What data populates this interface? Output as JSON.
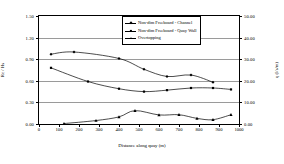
{
  "chart_data": {
    "type": "line",
    "title": "",
    "xlabel": "Distance along quay (m)",
    "ylabel": "Rc / Hs",
    "ylabel_right": "q (l/s/m)",
    "xlim": [
      0,
      1000
    ],
    "ylim": [
      0.0,
      1.5
    ],
    "ylim_right": [
      0.0,
      50.0
    ],
    "xticks": [
      0,
      100,
      200,
      300,
      400,
      500,
      600,
      700,
      800,
      900,
      1000
    ],
    "xticklabels": [
      "0",
      "100",
      "200",
      "300",
      "400",
      "500",
      "600",
      "700",
      "800",
      "900",
      "1000"
    ],
    "yticks": [
      0.0,
      0.3,
      0.6,
      0.9,
      1.2,
      1.5
    ],
    "yticklabels": [
      "0.00",
      "0.30",
      "0.60",
      "0.90",
      "1.20",
      "1.50"
    ],
    "yticks_right": [
      0.0,
      10.0,
      20.0,
      30.0,
      40.0,
      50.0
    ],
    "yticklabels_right": [
      "0.00",
      "10.00",
      "20.00",
      "30.00",
      "40.00",
      "50.00"
    ],
    "grid": true,
    "legend_position": "upper center",
    "series": [
      {
        "name": "Non-dim Freeboard - Channel",
        "axis": "left",
        "marker": "diamond",
        "x": [
          60,
          175,
          400,
          525,
          640,
          760,
          870
        ],
        "y": [
          0.97,
          1.0,
          0.91,
          0.76,
          0.66,
          0.68,
          0.58
        ]
      },
      {
        "name": "Non-dim Freeboard - Quay Wall",
        "axis": "left",
        "marker": "square",
        "x": [
          60,
          245,
          400,
          525,
          640,
          760,
          870,
          960
        ],
        "y": [
          0.78,
          0.59,
          0.49,
          0.45,
          0.47,
          0.5,
          0.5,
          0.48
        ]
      },
      {
        "name": "Overtopping",
        "axis": "right",
        "marker": "triangle",
        "x": [
          125,
          285,
          400,
          480,
          600,
          700,
          790,
          870,
          960
        ],
        "y": [
          0.2,
          1.6,
          3.3,
          6.2,
          4.2,
          4.3,
          2.6,
          2.0,
          4.3
        ]
      }
    ]
  },
  "legend": {
    "items": [
      {
        "label": "Non-dim Freeboard - Channel"
      },
      {
        "label": "Non-dim Freeboard - Quay Wall"
      },
      {
        "label": "Overtopping"
      }
    ]
  },
  "colors": {
    "line": "#000000",
    "grid": "#9a9a9a",
    "axis": "#000000",
    "background": "#ffffff"
  }
}
